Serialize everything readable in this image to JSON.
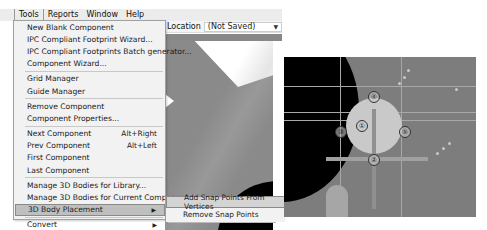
{
  "menubar": {
    "items": [
      {
        "label": "Tools",
        "active": true
      },
      {
        "label": "Reports"
      },
      {
        "label": "Window"
      },
      {
        "label": "Help"
      }
    ]
  },
  "toolbar": {
    "location_label": "Location",
    "location_value": "(Not Saved)"
  },
  "tools_menu": {
    "items": [
      {
        "label": "New Blank Component"
      },
      {
        "label": "IPC Compliant Footprint Wizard..."
      },
      {
        "label": "IPC Compliant Footprints Batch generator..."
      },
      {
        "label": "Component Wizard..."
      },
      {
        "label": "Grid Manager"
      },
      {
        "label": "Guide Manager"
      },
      {
        "label": "Remove Component"
      },
      {
        "label": "Component Properties..."
      },
      {
        "label": "Next Component",
        "shortcut": "Alt+Right"
      },
      {
        "label": "Prev Component",
        "shortcut": "Alt+Left"
      },
      {
        "label": "First Component"
      },
      {
        "label": "Last Component"
      },
      {
        "label": "Manage 3D Bodies for Library..."
      },
      {
        "label": "Manage 3D Bodies for Current Component..."
      },
      {
        "label": "3D Body Placement",
        "submenu": true,
        "highlighted": true
      },
      {
        "label": "Convert",
        "submenu": true
      }
    ]
  },
  "submenu_3d_body_placement": {
    "items": [
      {
        "label": "Add Snap Points From Vertices",
        "highlighted": true
      },
      {
        "label": "Remove Snap Points"
      }
    ]
  },
  "snap_markers": [
    "①",
    "②",
    "③",
    "④",
    "⑤"
  ]
}
